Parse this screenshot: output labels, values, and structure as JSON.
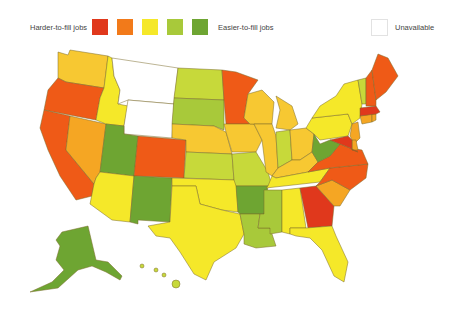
{
  "legend": {
    "left_label": "Harder-to-fill jobs",
    "right_label": "Easier-to-fill jobs",
    "unavailable_label": "Unavailable",
    "scale": [
      {
        "level": 1,
        "color": "#e0381c"
      },
      {
        "level": 2,
        "color": "#f27a1a"
      },
      {
        "level": 3,
        "color": "#f5e829"
      },
      {
        "level": 4,
        "color": "#a8c93a"
      },
      {
        "level": 5,
        "color": "#6ea532"
      }
    ],
    "unavailable_color": "#ffffff"
  },
  "colors": {
    "red": "#e0381c",
    "orange_red": "#ef5a17",
    "orange": "#f5a623",
    "yellow_orange": "#f7c832",
    "yellow": "#f5e829",
    "yellow_green": "#c7d93a",
    "green": "#a8c93a",
    "dark_green": "#6ea532",
    "none": "#ffffff"
  },
  "states": {
    "WA": "yellow_orange",
    "OR": "orange_red",
    "CA": "orange_red",
    "NV": "orange",
    "ID": "yellow",
    "MT": "none",
    "WY": "none",
    "UT": "dark_green",
    "AZ": "yellow",
    "CO": "orange_red",
    "NM": "dark_green",
    "ND": "yellow_green",
    "SD": "green",
    "NE": "yellow_orange",
    "KS": "yellow_green",
    "OK": "yellow",
    "TX": "yellow",
    "MN": "orange_red",
    "IA": "yellow_orange",
    "MO": "yellow_green",
    "AR": "dark_green",
    "LA": "green",
    "WI": "yellow_orange",
    "IL": "yellow_orange",
    "MS": "green",
    "MI": "yellow_orange",
    "IN": "yellow_green",
    "OH": "yellow_orange",
    "KY": "yellow_orange",
    "TN": "yellow",
    "AL": "yellow",
    "GA": "red",
    "FL": "yellow",
    "SC": "orange",
    "NC": "orange_red",
    "VA": "orange_red",
    "WV": "dark_green",
    "PA": "yellow",
    "NY": "yellow",
    "VT": "yellow_green",
    "NH": "orange_red",
    "ME": "orange_red",
    "MA": "red",
    "CT": "orange",
    "RI": "orange",
    "NJ": "orange",
    "DE": "orange",
    "MD": "red",
    "AK": "dark_green",
    "HI": "yellow_green"
  }
}
